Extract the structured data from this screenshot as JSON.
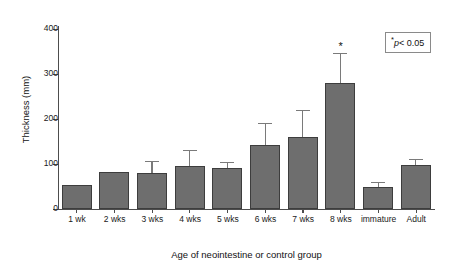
{
  "chart_data": {
    "type": "bar",
    "title": "",
    "xlabel": "Age of neointestine or control group",
    "ylabel": "Thickness (mm)",
    "ylim": [
      0,
      420
    ],
    "yticks": [
      0,
      100,
      200,
      300,
      400
    ],
    "ytick_labels": [
      "0",
      "100",
      "200",
      "300",
      "400"
    ],
    "grid": false,
    "legend_position": "top-right",
    "categories": [
      "1 wk",
      "2 wks",
      "3 wks",
      "4 wks",
      "5 wks",
      "6 wks",
      "7 wks",
      "8 wks",
      "immature",
      "Adult"
    ],
    "values": [
      55,
      85,
      82,
      98,
      93,
      146,
      165,
      290,
      50,
      101
    ],
    "errors_upper": [
      0,
      0,
      25,
      35,
      13,
      48,
      60,
      65,
      10,
      12
    ],
    "annotations": [
      {
        "category": "8 wks",
        "text": "*",
        "meaning": "significant"
      }
    ],
    "legend_note": {
      "star": "*",
      "p_symbol": "p",
      "comparison": "< 0.05",
      "full_text": "* p < 0.05"
    },
    "bar_color": "#6e6e6e",
    "bar_edge_color": "#3d3d3d",
    "error_bar_color": "#7a7a7a",
    "axis_color": "#4d4d4d",
    "background_color": "#ffffff"
  }
}
